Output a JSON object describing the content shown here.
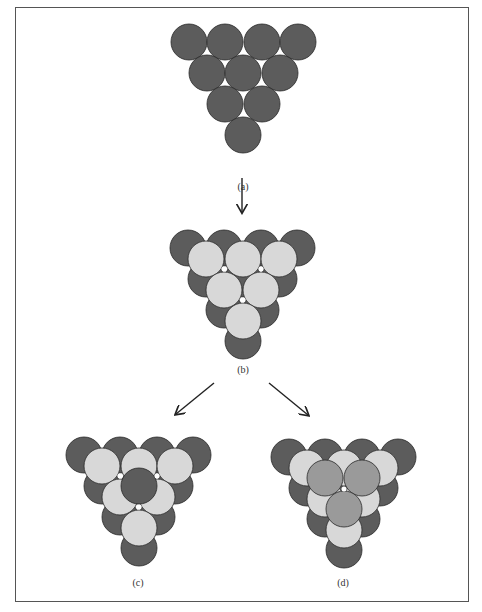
{
  "colors": {
    "dark": "#5c5c5c",
    "light": "#d8d8d8",
    "mid": "#9a9a9a",
    "stroke": "#2a2a2a",
    "hole": "#ffffff",
    "arrow": "#222222"
  },
  "radius": 18,
  "panels": [
    {
      "id": "a",
      "label": "(a)",
      "label_pos": [
        243,
        187
      ],
      "layers": [
        {
          "color": "dark",
          "centers": [
            [
              189,
              42
            ],
            [
              225,
              42
            ],
            [
              262,
              42
            ],
            [
              298,
              42
            ],
            [
              207,
              73
            ],
            [
              243,
              73
            ],
            [
              280,
              73
            ],
            [
              225,
              104
            ],
            [
              262,
              104
            ],
            [
              243,
              135
            ]
          ]
        }
      ],
      "holes": []
    },
    {
      "id": "b",
      "label": "(b)",
      "label_pos": [
        243,
        370
      ],
      "layers": [
        {
          "color": "dark",
          "centers": [
            [
              188,
              248
            ],
            [
              224,
              248
            ],
            [
              261,
              248
            ],
            [
              297,
              248
            ],
            [
              206,
              279
            ],
            [
              243,
              279
            ],
            [
              279,
              279
            ],
            [
              224,
              310
            ],
            [
              261,
              310
            ],
            [
              243,
              341
            ]
          ]
        },
        {
          "color": "light",
          "centers": [
            [
              206,
              259
            ],
            [
              243,
              259
            ],
            [
              279,
              259
            ],
            [
              224,
              290
            ],
            [
              261,
              290
            ],
            [
              243,
              321
            ]
          ]
        }
      ],
      "holes": [
        [
          224,
          269
        ],
        [
          261,
          269
        ],
        [
          243,
          300
        ]
      ]
    },
    {
      "id": "c",
      "label": "(c)",
      "label_pos": [
        138,
        583
      ],
      "layers": [
        {
          "color": "dark",
          "centers": [
            [
              84,
              455
            ],
            [
              120,
              455
            ],
            [
              157,
              455
            ],
            [
              193,
              455
            ],
            [
              102,
              486
            ],
            [
              139,
              486
            ],
            [
              175,
              486
            ],
            [
              120,
              517
            ],
            [
              157,
              517
            ],
            [
              139,
              548
            ]
          ]
        },
        {
          "color": "light",
          "centers": [
            [
              102,
              466
            ],
            [
              139,
              466
            ],
            [
              175,
              466
            ],
            [
              120,
              497
            ],
            [
              157,
              497
            ],
            [
              139,
              528
            ]
          ]
        },
        {
          "color": "dark",
          "centers": [
            [
              139,
              486
            ]
          ]
        }
      ],
      "holes": [
        [
          120,
          476
        ],
        [
          157,
          476
        ],
        [
          139,
          507
        ]
      ]
    },
    {
      "id": "d",
      "label": "(d)",
      "label_pos": [
        343,
        583
      ],
      "layers": [
        {
          "color": "dark",
          "centers": [
            [
              289,
              457
            ],
            [
              325,
              457
            ],
            [
              362,
              457
            ],
            [
              398,
              457
            ],
            [
              307,
              488
            ],
            [
              344,
              488
            ],
            [
              380,
              488
            ],
            [
              325,
              519
            ],
            [
              362,
              519
            ],
            [
              344,
              550
            ]
          ]
        },
        {
          "color": "light",
          "centers": [
            [
              307,
              468
            ],
            [
              344,
              468
            ],
            [
              380,
              468
            ],
            [
              325,
              499
            ],
            [
              362,
              499
            ],
            [
              344,
              530
            ]
          ]
        },
        {
          "color": "mid",
          "centers": [
            [
              325,
              478
            ],
            [
              362,
              478
            ],
            [
              344,
              509
            ]
          ]
        }
      ],
      "holes": [
        [
          344,
          489
        ]
      ]
    }
  ],
  "arrows": [
    {
      "name": "arrow-a-to-b",
      "from": [
        242,
        178
      ],
      "to": [
        242,
        212
      ]
    },
    {
      "name": "arrow-b-to-c",
      "from": [
        214,
        383
      ],
      "to": [
        176,
        414
      ]
    },
    {
      "name": "arrow-b-to-d",
      "from": [
        269,
        383
      ],
      "to": [
        308,
        415
      ]
    }
  ]
}
